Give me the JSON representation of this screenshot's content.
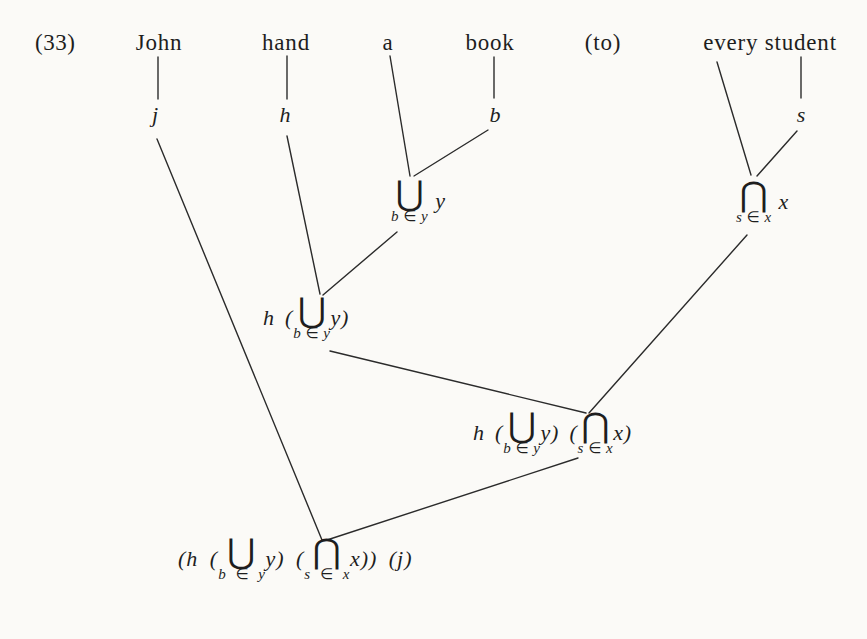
{
  "palette": {
    "ink": "#1e1e1e",
    "paper": "#fbfaf7"
  },
  "example": {
    "number": "(33)"
  },
  "sentence": {
    "words": [
      "John",
      "hand",
      "a",
      "book",
      "(to)",
      "every student"
    ]
  },
  "constants": [
    "j",
    "h",
    "b",
    "s"
  ],
  "nodes": {
    "union": {
      "operator": "⋃",
      "subscript": "b ∈ y",
      "argument": "y"
    },
    "intersection": {
      "operator": "⋂",
      "subscript": "s ∈ x",
      "argument": "x"
    },
    "h_union": {
      "prefix": "h (",
      "operator": "⋃",
      "subscript": "b ∈ y",
      "suffix": "y)"
    },
    "h_union_intersection": {
      "prefix": "h (",
      "op1": "⋃",
      "sub1": "b ∈ y",
      "mid": "y) (",
      "op2": "⋂",
      "sub2": "s ∈ x",
      "suffix": "x)"
    },
    "result": {
      "prefix": "(h (",
      "op1": "⋃",
      "sub1": "b ∈ y",
      "mid": "y) (",
      "op2": "⋂",
      "sub2": "s ∈ x",
      "suffix": "x)) (j)"
    }
  }
}
